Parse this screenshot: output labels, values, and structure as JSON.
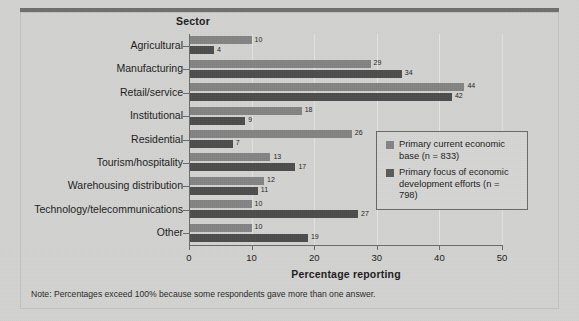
{
  "figure": {
    "y_axis_title": "Sector",
    "footnote": "Note: Percentages exceed 100% because some respondents gave more than one answer."
  },
  "legend": {
    "entries": [
      {
        "label": "Primary current economic base (n = 833)",
        "color": "#848484"
      },
      {
        "label": "Primary focus of economic development efforts (n = 798)",
        "color": "#5a5a5a"
      }
    ]
  },
  "chart_data": {
    "type": "bar",
    "orientation": "horizontal",
    "title": "",
    "subtitle": "",
    "xlabel": "Percentage reporting",
    "ylabel": "Sector",
    "xlim": [
      0,
      50
    ],
    "xticks": [
      0,
      10,
      20,
      30,
      40,
      50
    ],
    "xtick_labels": [
      "0",
      "10",
      "20",
      "30",
      "40",
      "50"
    ],
    "grid": true,
    "grid_axis": "x",
    "legend_position": "center-right",
    "categories": [
      "Agricultural",
      "Manufacturing",
      "Retail/service",
      "Institutional",
      "Residential",
      "Tourism/hospitality",
      "Warehousing distribution",
      "Technology/telecommunications",
      "Other"
    ],
    "series": [
      {
        "name": "Primary current economic base (n = 833)",
        "color": "#848484",
        "values": [
          10,
          29,
          44,
          18,
          26,
          13,
          12,
          10,
          10
        ]
      },
      {
        "name": "Primary focus of economic development efforts (n = 798)",
        "color": "#4d4d4d",
        "values": [
          4,
          34,
          42,
          9,
          7,
          17,
          11,
          27,
          19
        ]
      }
    ],
    "note": "Note: Percentages exceed 100% because some respondents gave more than one answer."
  }
}
